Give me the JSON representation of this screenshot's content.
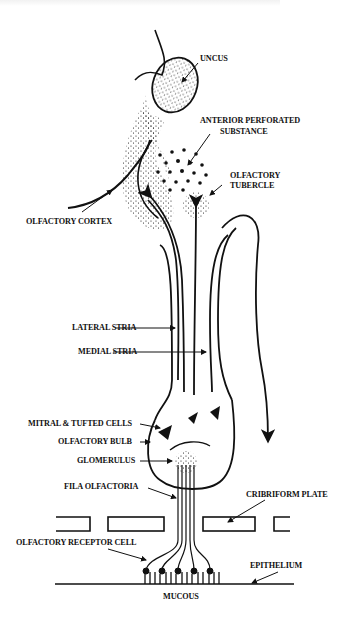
{
  "diagram": {
    "colors": {
      "ink": "#111111",
      "background": "#ffffff"
    },
    "labels": {
      "uncus": "UNCUS",
      "anterior_perforated_1": "ANTERIOR PERFORATED",
      "anterior_perforated_2": "SUBSTANCE",
      "olfactory_tubercle_1": "OLFACTORY",
      "olfactory_tubercle_2": "TUBERCLE",
      "olfactory_cortex": "OLFACTORY CORTEX",
      "lateral_stria": "LATERAL STRIA",
      "medial_stria": "MEDIAL STRIA",
      "mitral_tufted": "MITRAL & TUFTED CELLS",
      "olfactory_bulb": "OLFACTORY BULB",
      "glomerulus": "GLOMERULUS",
      "fila_olfactoria": "FILA OLFACTORIA",
      "cribriform_plate": "CRIBRIFORM PLATE",
      "receptor_cell": "OLFACTORY RECEPTOR CELL",
      "epithelium": "EPITHELIUM",
      "mucous": "MUCOUS"
    }
  }
}
